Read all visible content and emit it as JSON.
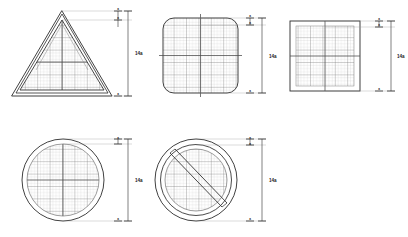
{
  "drawing": {
    "title": "Sign face grid layout drawing",
    "background_color": "#ffffff",
    "line_color": "#2b2b2b",
    "grid_color": "#8a8a8a",
    "grid_minor_color": "#b4b4b4",
    "extension_line_color": "#9a9a9a"
  },
  "figures": [
    {
      "id": "figure-triangle",
      "shape_name": "rounded-triangle-sign",
      "row": 1,
      "column": 1,
      "has_grid": true,
      "has_center_lines": true,
      "outline_style": "double",
      "dimension": {
        "main_label": "14a",
        "top_label_1": "a",
        "top_label_2": "a",
        "bottom_label": "a"
      }
    },
    {
      "id": "figure-rounded-square",
      "shape_name": "rounded-square-sign",
      "row": 1,
      "column": 2,
      "has_grid": true,
      "has_center_lines": true,
      "outline_style": "single",
      "dimension": {
        "main_label": "14a",
        "top_label_1": "a",
        "top_label_2": "a",
        "bottom_label": "a"
      }
    },
    {
      "id": "figure-square",
      "shape_name": "square-sign",
      "row": 1,
      "column": 3,
      "has_grid": true,
      "has_center_lines": true,
      "outline_style": "single",
      "dimension": {
        "main_label": "14a",
        "top_label_1": "a",
        "top_label_2": "a",
        "bottom_label": "a"
      }
    },
    {
      "id": "figure-circle",
      "shape_name": "circle-sign",
      "row": 2,
      "column": 1,
      "has_grid": true,
      "has_center_lines": true,
      "outline_style": "double",
      "dimension": {
        "main_label": "14a",
        "top_label_1": "a",
        "bottom_label": "a"
      }
    },
    {
      "id": "figure-prohibition",
      "shape_name": "prohibition-circle-sign",
      "row": 2,
      "column": 2,
      "has_grid": true,
      "has_center_lines": false,
      "has_diagonal_bar": true,
      "outline_style": "annulus",
      "dimension": {
        "main_label": "14a",
        "top_label_1": "a",
        "top_label_2": "a",
        "bottom_label": "a"
      }
    }
  ]
}
